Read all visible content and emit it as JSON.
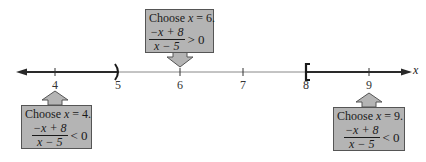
{
  "number_line": {
    "variable": "x",
    "ticks": [
      {
        "value": "4",
        "x": 55
      },
      {
        "value": "5",
        "x": 118
      },
      {
        "value": "6",
        "x": 180
      },
      {
        "value": "7",
        "x": 243
      },
      {
        "value": "8",
        "x": 306
      },
      {
        "value": "9",
        "x": 369
      }
    ],
    "shaded_left": {
      "to": "5",
      "endpoint": ")",
      "type": "open"
    },
    "shaded_right": {
      "from": "8",
      "endpoint": "[",
      "type": "closed"
    },
    "colors": {
      "line": "#2a2a2a",
      "thin_line": "#888888",
      "box_fill": "#b4b4b4",
      "box_border": "#555555"
    }
  },
  "callouts": [
    {
      "id": "test-6",
      "choose_prefix": "Choose ",
      "var": "x",
      "choose_suffix": " = 6.",
      "numerator": "−x + 8",
      "denominator": "x − 5",
      "inequality": "> 0",
      "arrow": "down"
    },
    {
      "id": "test-4",
      "choose_prefix": "Choose ",
      "var": "x",
      "choose_suffix": " = 4.",
      "numerator": "−x + 8",
      "denominator": "x − 5",
      "inequality": "< 0",
      "arrow": "up"
    },
    {
      "id": "test-9",
      "choose_prefix": "Choose ",
      "var": "x",
      "choose_suffix": " = 9.",
      "numerator": "−x + 8",
      "denominator": "x − 5",
      "inequality": "< 0",
      "arrow": "up"
    }
  ]
}
